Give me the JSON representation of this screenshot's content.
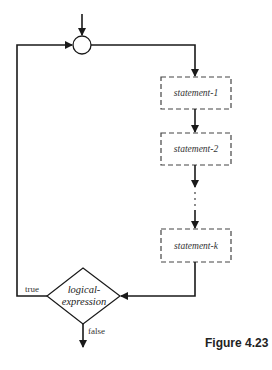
{
  "diagram": {
    "type": "flowchart",
    "statements": [
      {
        "id": "s1",
        "label": "statement-1"
      },
      {
        "id": "s2",
        "label": "statement-2"
      },
      {
        "id": "sk",
        "label": "statement-k"
      }
    ],
    "ellipsis": "...",
    "condition": {
      "line1": "logical-",
      "line2": "expression",
      "true_label": "true",
      "false_label": "false"
    },
    "caption": "Figure 4.23",
    "colors": {
      "stroke": "#1a1a1a",
      "box_stroke": "#444444",
      "background": "#ffffff"
    }
  }
}
